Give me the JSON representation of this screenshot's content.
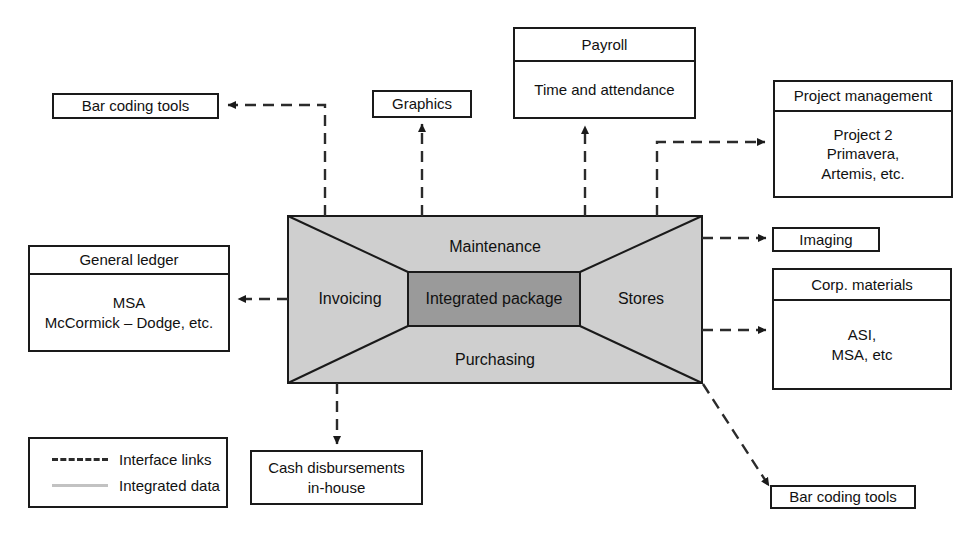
{
  "diagram": {
    "colors": {
      "outer_fill": "#cfcfcf",
      "inner_fill": "#9a9a9a",
      "stroke": "#1a1a1a",
      "link_dashed": "#2b2b2b",
      "link_solid": "#c2c2c2",
      "background": "#ffffff"
    }
  },
  "central": {
    "inner_label": "Integrated package",
    "top_label": "Maintenance",
    "bottom_label": "Purchasing",
    "left_label": "Invoicing",
    "right_label": "Stores"
  },
  "nodes": {
    "bar_coding_top": {
      "label": "Bar coding tools"
    },
    "graphics": {
      "label": "Graphics"
    },
    "payroll": {
      "header": "Payroll",
      "body": "Time and attendance"
    },
    "project_management": {
      "header": "Project management",
      "body": "Project 2\nPrimavera,\nArtemis, etc."
    },
    "imaging": {
      "label": "Imaging"
    },
    "corp_materials": {
      "header": "Corp. materials",
      "body": "ASI,\nMSA, etc"
    },
    "general_ledger": {
      "header": "General ledger",
      "body": "MSA\nMcCormick – Dodge, etc."
    },
    "cash_disbursements": {
      "label": "Cash disbursements\nin-house"
    },
    "bar_coding_bottom": {
      "label": "Bar coding tools"
    }
  },
  "legend": {
    "items": [
      {
        "style": "dashed",
        "label": "Interface links"
      },
      {
        "style": "solid",
        "label": "Integrated data"
      }
    ]
  }
}
